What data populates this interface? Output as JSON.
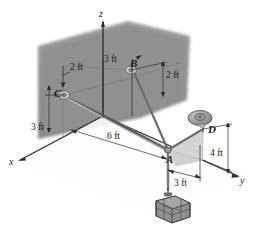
{
  "figure": {
    "type": "engineering-statics-3d-diagram",
    "axes": {
      "z": {
        "label": "z"
      },
      "x": {
        "label": "x"
      },
      "y": {
        "label": "y"
      }
    },
    "points": [
      {
        "id": "A",
        "label": "A"
      },
      {
        "id": "B",
        "label": "B"
      },
      {
        "id": "C",
        "label": "C"
      },
      {
        "id": "D",
        "label": "D"
      }
    ],
    "dimensions": [
      {
        "id": "c-offset-x",
        "label": "2 ft"
      },
      {
        "id": "b-offset-x",
        "label": "3 ft"
      },
      {
        "id": "b-height",
        "label": "2 ft"
      },
      {
        "id": "c-height",
        "label": "3 ft"
      },
      {
        "id": "a-distance",
        "label": "6 ft"
      },
      {
        "id": "d-height",
        "label": "4 ft"
      },
      {
        "id": "d-offset-y",
        "label": "3 ft"
      }
    ],
    "colors": {
      "wall": "#8e8e8e",
      "plane": "#d2d2d2",
      "cable": "#6b6b6b",
      "crate": "#8a8a8a",
      "ink": "#1a1a1a"
    }
  }
}
